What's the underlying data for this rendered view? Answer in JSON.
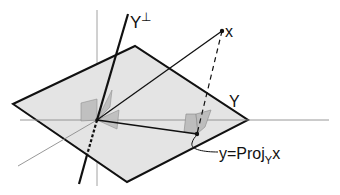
{
  "labels": {
    "perp": "Y",
    "perp_sup": "⊥",
    "vector_x": "x",
    "subspace": "Y",
    "proj_prefix": "y=Proj",
    "proj_sub": "Y",
    "proj_suffix": "x"
  },
  "colors": {
    "plane_fill": "#e4e4e4",
    "plane_stroke": "#111111",
    "axis": "#8c8c8c",
    "right_angle_fill": "#bdbdbd",
    "ink": "#111111"
  }
}
